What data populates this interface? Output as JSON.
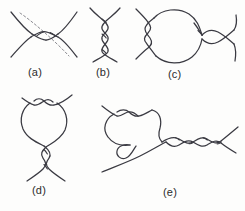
{
  "figure": {
    "background_color": "#fdfdfc",
    "stroke_color": "#3a3a42",
    "dashed_guide_color": "#8a8a90",
    "caption_color": "#2b2b2b"
  },
  "panels": [
    {
      "id": "a",
      "caption": "(a)",
      "description": "Two strands crossing with a two-crossing twist, overlaid by a dashed diagonal guide line",
      "has_dashed_guide": true,
      "crossings": 2
    },
    {
      "id": "b",
      "caption": "(b)",
      "description": "Vertical two-strand braid with four crossings",
      "has_dashed_guide": false,
      "crossings": 4
    },
    {
      "id": "c",
      "caption": "(c)",
      "description": "Left vertical braid joined to a large loop and a right-hand crossing pair",
      "has_dashed_guide": false,
      "crossings": 5
    },
    {
      "id": "d",
      "caption": "(d)",
      "description": "Closed loop with two crossings at the top and a braided tail with two crossings below",
      "has_dashed_guide": false,
      "crossings": 4
    },
    {
      "id": "e",
      "caption": "(e)",
      "description": "Knotted loop on the left with a small curl, joined to a horizontal braid of four crossings on the right",
      "has_dashed_guide": false,
      "crossings": 7
    }
  ]
}
